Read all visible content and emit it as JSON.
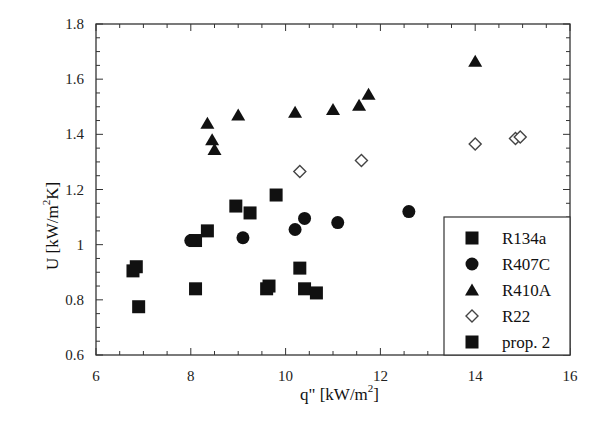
{
  "chart_data": {
    "type": "scatter",
    "title": "",
    "xlabel": "q\"  [kW/m²]",
    "ylabel": "U [kW/m²K]",
    "xlim": [
      6,
      16
    ],
    "ylim": [
      0.6,
      1.8
    ],
    "xticks": [
      6,
      8,
      10,
      12,
      14,
      16
    ],
    "yticks": [
      0.6,
      0.8,
      1,
      1.2,
      1.4,
      1.6,
      1.8
    ],
    "xtick_labels": [
      "6",
      "8",
      "10",
      "12",
      "14",
      "16"
    ],
    "ytick_labels": [
      "0.6",
      "0.8",
      "1",
      "1.2",
      "1.4",
      "1.6",
      "1.8"
    ],
    "x_minor_step": 0.5,
    "y_minor_step": 0.05,
    "grid": false,
    "legend_position": "lower right",
    "series": [
      {
        "name": "R134a",
        "marker": "filled-square",
        "points": [
          [
            6.78,
            0.905
          ],
          [
            6.85,
            0.92
          ],
          [
            6.9,
            0.775
          ],
          [
            8.1,
            0.84
          ],
          [
            8.35,
            1.05
          ],
          [
            8.95,
            1.14
          ],
          [
            9.25,
            1.115
          ],
          [
            9.8,
            1.18
          ],
          [
            9.6,
            0.84
          ],
          [
            9.65,
            0.85
          ],
          [
            10.3,
            0.915
          ],
          [
            10.4,
            0.84
          ],
          [
            10.65,
            0.825
          ],
          [
            8.1,
            1.015
          ]
        ]
      },
      {
        "name": "R407C",
        "marker": "filled-circle",
        "points": [
          [
            8.0,
            1.015
          ],
          [
            9.1,
            1.025
          ],
          [
            10.2,
            1.055
          ],
          [
            10.4,
            1.095
          ],
          [
            11.1,
            1.08
          ],
          [
            12.6,
            1.12
          ]
        ]
      },
      {
        "name": "R410A",
        "marker": "filled-triangle",
        "points": [
          [
            8.35,
            1.44
          ],
          [
            8.45,
            1.38
          ],
          [
            8.5,
            1.345
          ],
          [
            9.0,
            1.47
          ],
          [
            10.2,
            1.48
          ],
          [
            11.0,
            1.49
          ],
          [
            11.55,
            1.505
          ],
          [
            11.75,
            1.545
          ],
          [
            14.0,
            1.665
          ]
        ]
      },
      {
        "name": "R22",
        "marker": "open-diamond",
        "points": [
          [
            10.3,
            1.265
          ],
          [
            11.6,
            1.305
          ],
          [
            14.0,
            1.365
          ],
          [
            14.85,
            1.385
          ],
          [
            14.95,
            1.39
          ]
        ]
      },
      {
        "name": "prop. 2",
        "marker": "filled-square",
        "points": []
      }
    ]
  },
  "legend": {
    "items": [
      {
        "label": "R134a",
        "marker": "square"
      },
      {
        "label": "R407C",
        "marker": "circle"
      },
      {
        "label": "R410A",
        "marker": "triangle"
      },
      {
        "label": "R22",
        "marker": "diamond"
      },
      {
        "label": "prop. 2",
        "marker": "square"
      }
    ]
  },
  "axes": {
    "x_label_main": "q\"  [kW/m",
    "x_label_sup": "2",
    "x_label_end": "]",
    "y_label_main": "U [kW/m",
    "y_label_sup": "2",
    "y_label_end": "K]"
  },
  "colors": {
    "ink": "#111111",
    "background": "#ffffff",
    "frame": "#333333"
  }
}
